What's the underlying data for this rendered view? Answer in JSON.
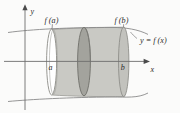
{
  "figure": {
    "background_color": "#fbfbfa",
    "axes": {
      "x_axis_label": "x",
      "y_axis_label": "y",
      "axis_color": "#6e6e6e",
      "x_axis_y": 61,
      "y_axis_x": 25
    },
    "curve": {
      "equation_label": "y = f (x)",
      "curve_color": "#8a8a8a"
    },
    "labels": {
      "f_of_a": "f (a)",
      "f_of_b": "f (b)",
      "a": "a",
      "b": "b"
    },
    "solid": {
      "body_fill": "#c9c9c4",
      "body_stroke": "#8f8f8a",
      "left_disk_fill": "#ffffff",
      "left_disk_stroke": "#8f8f8a",
      "representative_disk_fill": "#a3a39d",
      "representative_disk_stroke": "#6f6f6a",
      "right_cap_fill": "#c2c2bd"
    }
  }
}
